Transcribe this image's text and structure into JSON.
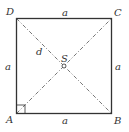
{
  "diagram": {
    "vertices": {
      "A": "A",
      "B": "B",
      "C": "C",
      "D": "D"
    },
    "center": "S",
    "side_labels": {
      "top": "a",
      "bottom": "a",
      "left": "a",
      "right": "a"
    },
    "diagonal_label": "d",
    "colors": {
      "stroke": "#333333",
      "background": "#ffffff"
    }
  }
}
